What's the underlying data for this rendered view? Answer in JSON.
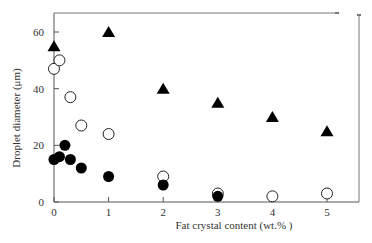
{
  "chart_data": {
    "type": "scatter",
    "title": "",
    "xlabel": "Fat crystal content (wt.% )",
    "ylabel": "Droplet diameter (μm)",
    "xlim": [
      0,
      5.6
    ],
    "ylim": [
      0,
      67
    ],
    "x_ticks": [
      0,
      1,
      2,
      3,
      4,
      5
    ],
    "y_ticks": [
      0,
      20,
      40,
      60
    ],
    "grid": false,
    "legend": "none",
    "series": [
      {
        "name": "filled-triangle",
        "marker": "triangle-filled",
        "x": [
          0,
          1,
          2,
          3,
          4,
          5
        ],
        "y": [
          55,
          60,
          40,
          35,
          30,
          25
        ]
      },
      {
        "name": "open-circle",
        "marker": "circle-open",
        "x": [
          0,
          0.1,
          0.3,
          0.5,
          1,
          2,
          3,
          4,
          5
        ],
        "y": [
          47,
          50,
          37,
          27,
          24,
          9,
          3,
          2,
          3
        ]
      },
      {
        "name": "filled-circle",
        "marker": "circle-filled",
        "x": [
          0,
          0.1,
          0.2,
          0.3,
          0.5,
          1,
          2,
          3
        ],
        "y": [
          15,
          16,
          20,
          15,
          12,
          9,
          6,
          2
        ]
      }
    ]
  },
  "axes": {
    "x_tick_labels": [
      "0",
      "1",
      "2",
      "3",
      "4",
      "5"
    ],
    "y_tick_labels": [
      "0",
      "20",
      "40",
      "60"
    ],
    "xlabel": "Fat crystal content (wt.% )",
    "ylabel": "Droplet diameter (μm)"
  }
}
